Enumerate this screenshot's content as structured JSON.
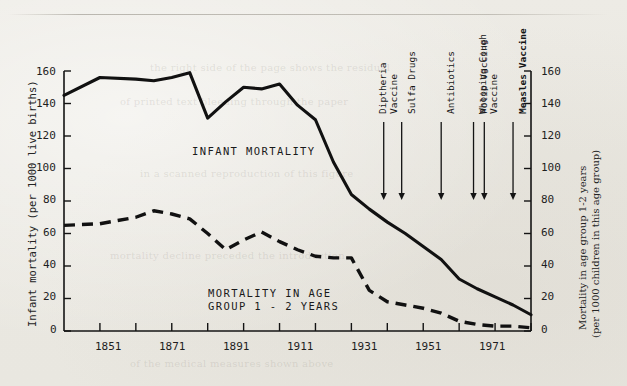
{
  "figure": {
    "background_color": "#eceae4",
    "ink_color": "#141414"
  },
  "chart_data": {
    "type": "line",
    "title": "",
    "xlabel": "",
    "ylabel": "Infant mortality (per 1000 live births)",
    "y2label": "Mortality in age group 1-2 years (per 1000 children in this age group)",
    "xlim": [
      1841,
      1971
    ],
    "ylim": [
      0,
      160
    ],
    "y2lim": [
      0,
      160
    ],
    "grid": false,
    "legend_position": "inline-annotations",
    "xticks": [
      1841,
      1851,
      1861,
      1871,
      1881,
      1891,
      1901,
      1911,
      1921,
      1931,
      1941,
      1951,
      1961,
      1971
    ],
    "xticklabels": [
      "",
      "1851",
      "",
      "1871",
      "",
      "1891",
      "",
      "1911",
      "",
      "1931",
      "",
      "1951",
      "",
      "1971"
    ],
    "yticks": [
      0,
      20,
      40,
      60,
      80,
      100,
      120,
      140,
      160
    ],
    "yticklabels": [
      "0",
      "20",
      "40",
      "60",
      "80",
      "100",
      "120",
      "140",
      "160"
    ],
    "y2ticks": [
      0,
      20,
      40,
      60,
      80,
      100,
      120,
      140,
      160
    ],
    "y2ticklabels": [
      "0",
      "20",
      "40",
      "60",
      "80",
      "100",
      "120",
      "140",
      "160"
    ],
    "x": [
      1841,
      1851,
      1861,
      1866,
      1871,
      1876,
      1881,
      1886,
      1891,
      1896,
      1901,
      1906,
      1911,
      1916,
      1921,
      1926,
      1931,
      1936,
      1941,
      1946,
      1951,
      1956,
      1961,
      1966,
      1971
    ],
    "series": [
      {
        "name": "INFANT MORTALITY",
        "style": "solid",
        "axis": "left",
        "values": [
          145,
          156,
          155,
          154,
          156,
          159,
          131,
          141,
          150,
          149,
          152,
          139,
          130,
          104,
          84,
          75,
          67,
          60,
          52,
          44,
          32,
          26,
          21,
          16,
          10
        ]
      },
      {
        "name": "MORTALITY IN AGE GROUP 1 - 2 YEARS",
        "style": "dashed",
        "axis": "right",
        "values": [
          65,
          66,
          70,
          74,
          72,
          69,
          60,
          50,
          56,
          61,
          55,
          50,
          46,
          45,
          45,
          25,
          18,
          16,
          14,
          11,
          6,
          4,
          3,
          3,
          2
        ]
      }
    ],
    "annotations": [
      {
        "label": "Diptheria\nVaccine",
        "label_lines": [
          "Diptheria",
          "Vaccine"
        ],
        "year": 1930,
        "bold": false
      },
      {
        "label": "Sulfa Drugs",
        "label_lines": [
          "Sulfa Drugs"
        ],
        "year": 1935,
        "bold": false
      },
      {
        "label": "Antibiotics",
        "label_lines": [
          "Antibiotics"
        ],
        "year": 1946,
        "bold": false
      },
      {
        "label": "Polio Vaccine",
        "label_lines": [
          "Polio Vaccine"
        ],
        "year": 1955,
        "bold": false
      },
      {
        "label": "Whooping Cough\nVaccine",
        "label_lines": [
          "Whooping Cough",
          "Vaccine"
        ],
        "year": 1958,
        "bold": false
      },
      {
        "label": "Measles Vaccine",
        "label_lines": [
          "Measles Vaccine"
        ],
        "year": 1966,
        "bold": true
      }
    ],
    "inline_labels": [
      {
        "text": "INFANT MORTALITY",
        "series": "INFANT MORTALITY"
      },
      {
        "text": "MORTALITY IN AGE\nGROUP 1 - 2 YEARS",
        "series": "MORTALITY IN AGE GROUP 1 - 2 YEARS"
      }
    ]
  },
  "annotation_text": {
    "a0_l0": "Diptheria",
    "a0_l1": "Vaccine",
    "a1_l0": "Sulfa Drugs",
    "a2_l0": "Antibiotics",
    "a3_l0": "Polio Vaccine",
    "a4_l0": "Whooping Cough",
    "a4_l1": "Vaccine",
    "a5_l0": "Measles Vaccine"
  },
  "inline": {
    "infant_mortality": "INFANT MORTALITY",
    "age_group_line1": "MORTALITY IN AGE",
    "age_group_line2": "GROUP 1 - 2 YEARS"
  },
  "axis_titles": {
    "left": "Infant mortality (per 1000 live births)",
    "right_line1": "Mortality in age group 1-2 years",
    "right_line2": "(per 1000 children in this age group)"
  },
  "yticks": {
    "t0": "0",
    "t20": "20",
    "t40": "40",
    "t60": "60",
    "t80": "80",
    "t100": "100",
    "t120": "120",
    "t140": "140",
    "t160": "160"
  },
  "y2ticks": {
    "t0": "0",
    "t20": "20",
    "t40": "40",
    "t60": "60",
    "t80": "80",
    "t100": "100",
    "t120": "120",
    "t140": "140",
    "t160": "160"
  },
  "xticks": {
    "x1851": "1851",
    "x1871": "1871",
    "x1891": "1891",
    "x1911": "1911",
    "x1931": "1931",
    "x1951": "1951",
    "x1971": "1971"
  },
  "ghost_text": {
    "g1": "the right side of the page shows the residual",
    "g2": "of printed text bleeding through the paper",
    "g3": "in a scanned reproduction of this figure",
    "g4": "mortality decline preceded the introduction",
    "g5": "of the medical measures shown above"
  }
}
